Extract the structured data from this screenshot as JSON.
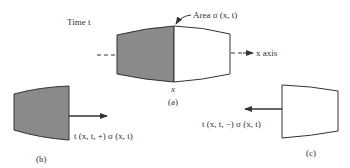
{
  "figure": {
    "panel_a": {
      "time_label": "Time t",
      "area_label": "Area σ (x, t)",
      "axis_label": "x axis",
      "x_label": "x",
      "caption": "(a)"
    },
    "panel_b": {
      "traction_label": "t (x, t, +) σ (x, t)",
      "caption": "(b)"
    },
    "panel_c": {
      "traction_label": "t (x, t, −) σ (x, t)",
      "caption": "(c)"
    }
  },
  "colors": {
    "shaded": "#8a8a8a",
    "stroke": "#333333",
    "background": "#ffffff"
  }
}
